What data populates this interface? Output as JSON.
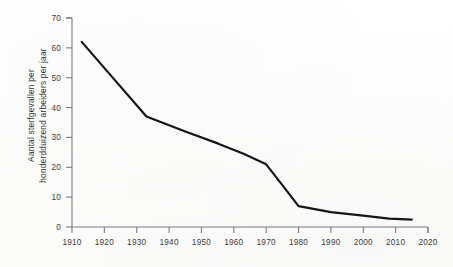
{
  "figure": {
    "background_color": "#fefefe",
    "ink_color": "#161616",
    "axis_color": "#7d7d7d"
  },
  "axis_titles": {
    "y_line1": "Aantal sterfgevallen per",
    "y_line2": "honderdduizend arbeiders per jaar",
    "x": ""
  },
  "chart_data": {
    "type": "line",
    "title": "",
    "subtitle": "",
    "xlabel": "",
    "ylabel": "Aantal sterfgevallen per honderdduizend arbeiders per jaar",
    "xlim": [
      1910,
      2020
    ],
    "ylim": [
      0,
      70
    ],
    "grid": false,
    "legend": "none",
    "x_ticks": [
      1910,
      1920,
      1930,
      1940,
      1950,
      1960,
      1970,
      1980,
      1990,
      2000,
      2010,
      2020
    ],
    "y_ticks": [
      0,
      10,
      20,
      30,
      40,
      50,
      60,
      70
    ],
    "series": [
      {
        "name": "Sterfgevallen per honderdduizend arbeiders per jaar",
        "color": "#161616",
        "x": [
          1913,
          1933,
          1945,
          1955,
          1963,
          1970,
          1975,
          1980,
          1990,
          2000,
          2008,
          2015
        ],
        "values": [
          62,
          37,
          32,
          28,
          24.5,
          21,
          14,
          7,
          5,
          3.8,
          2.8,
          2.5
        ]
      }
    ]
  }
}
